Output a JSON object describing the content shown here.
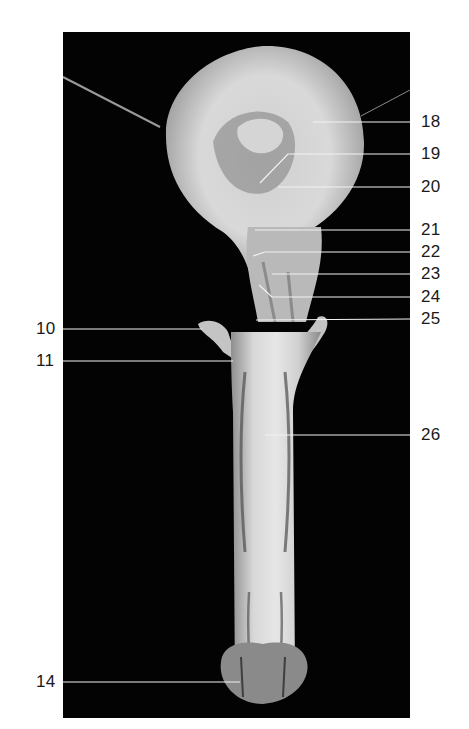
{
  "figure": {
    "background": "#ffffff",
    "photo_background": "#030303",
    "line_color": "#f2f2f2",
    "label_color": "#1a1a1a"
  },
  "labels": [
    {
      "id": "18",
      "text": "18",
      "side": "right",
      "x": 420,
      "y": 122,
      "target_x": 313,
      "target_y": 122
    },
    {
      "id": "19",
      "text": "19",
      "side": "right",
      "x": 420,
      "y": 154,
      "target_x": 260,
      "target_y": 183,
      "bend_x": 288
    },
    {
      "id": "20",
      "text": "20",
      "side": "right",
      "x": 420,
      "y": 187,
      "target_x": 278,
      "target_y": 187
    },
    {
      "id": "21",
      "text": "21",
      "side": "right",
      "x": 420,
      "y": 230,
      "target_x": 255,
      "target_y": 230
    },
    {
      "id": "22",
      "text": "22",
      "side": "right",
      "x": 420,
      "y": 252,
      "target_x": 253,
      "target_y": 256,
      "bend_x": 265
    },
    {
      "id": "23",
      "text": "23",
      "side": "right",
      "x": 420,
      "y": 274,
      "target_x": 272,
      "target_y": 274
    },
    {
      "id": "24",
      "text": "24",
      "side": "right",
      "x": 420,
      "y": 297,
      "target_x": 259,
      "target_y": 285,
      "bend_x": 272
    },
    {
      "id": "25",
      "text": "25",
      "side": "right",
      "x": 420,
      "y": 319,
      "target_x": 256,
      "target_y": 320
    },
    {
      "id": "26",
      "text": "26",
      "side": "right",
      "x": 420,
      "y": 435,
      "target_x": 265,
      "target_y": 435
    },
    {
      "id": "10",
      "text": "10",
      "side": "left",
      "x": 35,
      "y": 329,
      "target_x": 202,
      "target_y": 329
    },
    {
      "id": "11",
      "text": "11",
      "side": "left",
      "x": 35,
      "y": 361,
      "target_x": 233,
      "target_y": 361
    },
    {
      "id": "14",
      "text": "14",
      "side": "left",
      "x": 35,
      "y": 682,
      "target_x": 240,
      "target_y": 682
    }
  ]
}
